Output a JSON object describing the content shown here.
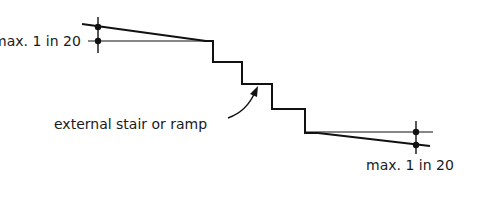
{
  "diagram": {
    "colors": {
      "line": "#111111",
      "text": "#1a1a1a",
      "background": "#ffffff"
    },
    "labels": {
      "top_gradient": "max. 1 in 20",
      "bottom_gradient": "max. 1 in 20",
      "stair_callout": "external stair or ramp"
    },
    "elements": [
      {
        "name": "top-landing",
        "description": "sloped landing above stair, max gradient 1 in 20"
      },
      {
        "name": "stair-flight",
        "description": "four risers stepping down"
      },
      {
        "name": "bottom-landing",
        "description": "sloped landing below stair, max gradient 1 in 20"
      },
      {
        "name": "callout-arrow",
        "description": "curved arrow pointing to stair"
      }
    ]
  }
}
